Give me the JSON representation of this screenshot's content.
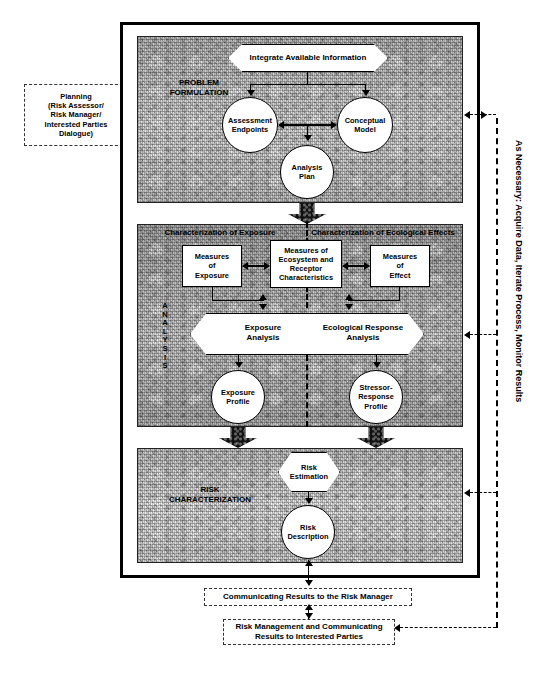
{
  "diagram": {
    "left_box": {
      "name": "planning-box",
      "lines": [
        "Planning",
        "(Risk Assessor/",
        "Risk Manager/",
        "Interested Parties",
        "Dialogue)"
      ]
    },
    "right_label": "As Necessary: Acquire Data, Iterate Process, Monitor Results",
    "problem_formulation": {
      "section_label_lines": [
        "PROBLEM",
        "FORMULATION"
      ],
      "integrate": "Integrate Available Information",
      "assessment_endpoints": [
        "Assessment",
        "Endpoints"
      ],
      "conceptual_model": [
        "Conceptual",
        "Model"
      ],
      "analysis_plan": [
        "Analysis",
        "Plan"
      ]
    },
    "analysis": {
      "section_label": "ANALYSIS",
      "section_label_letters": [
        "A",
        "N",
        "A",
        "L",
        "Y",
        "S",
        "I",
        "S"
      ],
      "heading_left": "Characterization of Exposure",
      "heading_right": "Characterization of Ecological Effects",
      "measures_of_exposure": [
        "Measures",
        "of",
        "Exposure"
      ],
      "measures_of_ecosystem": [
        "Measures of",
        "Ecosystem and",
        "Receptor",
        "Characteristics"
      ],
      "measures_of_effect": [
        "Measures",
        "of",
        "Effect"
      ],
      "exposure_analysis": [
        "Exposure",
        "Analysis"
      ],
      "ecological_response_analysis": [
        "Ecological Response",
        "Analysis"
      ],
      "exposure_profile": [
        "Exposure",
        "Profile"
      ],
      "stressor_response_profile": [
        "Stressor-",
        "Response",
        "Profile"
      ]
    },
    "risk_characterization": {
      "section_label_lines": [
        "RISK",
        "CHARACTERIZATION"
      ],
      "risk_estimation": [
        "Risk",
        "Estimation"
      ],
      "risk_description": [
        "Risk",
        "Description"
      ]
    },
    "bottom": {
      "communicating": "Communicating Results to the Risk Manager",
      "risk_management": [
        "Risk Management and Communicating",
        "Results to Interested Parties"
      ]
    },
    "colors": {
      "ink": "#000000",
      "panel_fill": "#cfcfcf",
      "shape_fill": "#ffffff"
    }
  }
}
